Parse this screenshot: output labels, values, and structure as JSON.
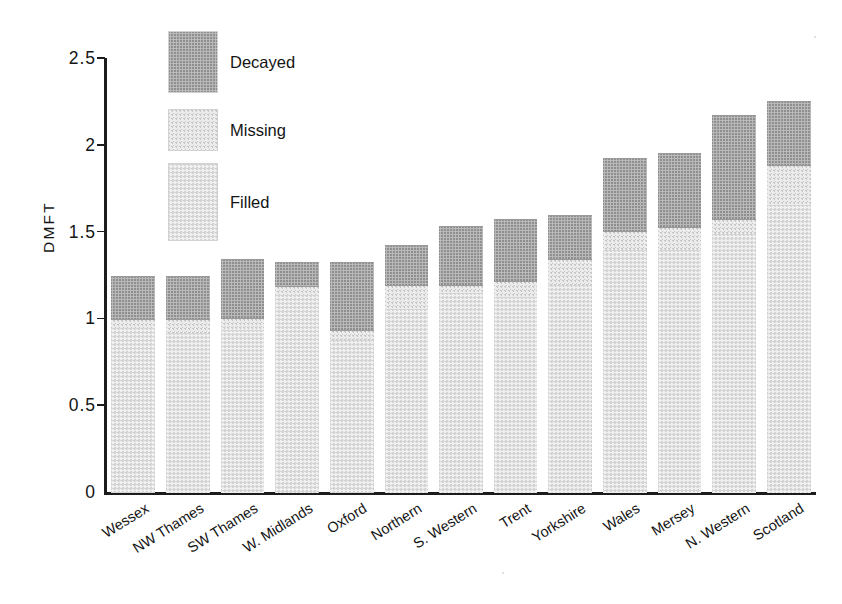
{
  "chart_data": {
    "type": "bar",
    "subtype": "stacked",
    "title": "",
    "xlabel": "",
    "ylabel": "DMFT",
    "ylim": [
      0,
      2.5
    ],
    "yticks": [
      "0",
      "0.5",
      "1",
      "1.5",
      "2",
      "2.5"
    ],
    "ytick_values": [
      0,
      0.5,
      1,
      1.5,
      2,
      2.5
    ],
    "grid": false,
    "legend_position": "upper-left-inside",
    "categories": [
      "Wessex",
      "NW Thames",
      "SW Thames",
      "W. Midlands",
      "Oxford",
      "Northern",
      "S. Western",
      "Trent",
      "Yorkshire",
      "Wales",
      "Mersey",
      "N. Western",
      "Scotland"
    ],
    "series": [
      {
        "name": "Filled",
        "color": "#f0f0f0",
        "values": [
          0.95,
          0.92,
          0.94,
          1.14,
          0.88,
          1.06,
          1.15,
          1.13,
          1.2,
          1.4,
          1.4,
          1.49,
          1.66
        ]
      },
      {
        "name": "Missing",
        "color": "#ececec",
        "values": [
          0.05,
          0.08,
          0.07,
          0.05,
          0.06,
          0.14,
          0.05,
          0.09,
          0.15,
          0.11,
          0.13,
          0.09,
          0.23
        ]
      },
      {
        "name": "Decayed",
        "color": "#b9b9b9",
        "values": [
          0.25,
          0.25,
          0.34,
          0.14,
          0.39,
          0.23,
          0.34,
          0.36,
          0.25,
          0.42,
          0.43,
          0.6,
          0.37
        ]
      }
    ],
    "totals": [
      1.25,
      1.25,
      1.35,
      1.33,
      1.33,
      1.43,
      1.54,
      1.58,
      1.6,
      1.93,
      1.96,
      2.18,
      2.26
    ],
    "stack_order_bottom_to_top": [
      "Filled",
      "Missing",
      "Decayed"
    ]
  },
  "legend": {
    "items": [
      {
        "label": "Decayed",
        "swatch": "decayed-swatch"
      },
      {
        "label": "Missing",
        "swatch": "missing-swatch"
      },
      {
        "label": "Filled",
        "swatch": "filled-swatch"
      }
    ]
  },
  "axes": {
    "y_title": "DMFT"
  }
}
